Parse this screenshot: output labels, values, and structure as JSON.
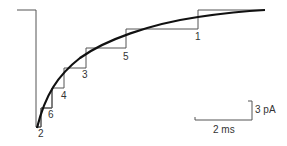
{
  "figure": {
    "type": "current trace with fitted staircase",
    "step_labels": [
      "2",
      "6",
      "4",
      "3",
      "5",
      "1"
    ],
    "scale_bar": {
      "vertical_label": "3 pA",
      "horizontal_label": "2 ms"
    },
    "colors": {
      "trace": "#555555",
      "fit_curve": "#111111",
      "text": "#333333"
    }
  }
}
